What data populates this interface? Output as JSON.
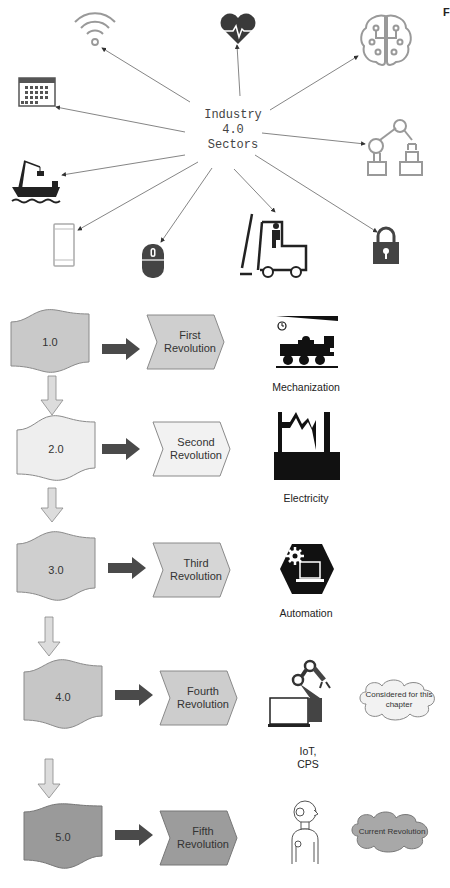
{
  "corner_mark": "F",
  "sectors": {
    "center_label_lines": [
      "Industry",
      "4.0",
      "Sectors"
    ],
    "items": [
      {
        "icon": "wifi-icon",
        "name": "connectivity"
      },
      {
        "icon": "heart-rate-icon",
        "name": "healthcare"
      },
      {
        "icon": "ai-brain-icon",
        "name": "artificial-intelligence"
      },
      {
        "icon": "calendar-icon",
        "name": "scheduling"
      },
      {
        "icon": "robot-arm-icon",
        "name": "robotics"
      },
      {
        "icon": "cargo-ship-icon",
        "name": "shipping"
      },
      {
        "icon": "smartphone-icon",
        "name": "mobile"
      },
      {
        "icon": "mouse-icon",
        "name": "computing"
      },
      {
        "icon": "forklift-icon",
        "name": "logistics"
      },
      {
        "icon": "padlock-icon",
        "name": "security"
      }
    ]
  },
  "revolutions": [
    {
      "version": "1.0",
      "title_lines": [
        "First",
        "Revolution"
      ],
      "era": "Mechanization",
      "era_icon": "steam-locomotive-icon",
      "fill": "#c9c9c9"
    },
    {
      "version": "2.0",
      "title_lines": [
        "Second",
        "Revolution"
      ],
      "era": "Electricity",
      "era_icon": "factory-power-icon",
      "fill": "#eeeeee"
    },
    {
      "version": "3.0",
      "title_lines": [
        "Third",
        "Revolution"
      ],
      "era": "Automation",
      "era_icon": "automation-hexagon-icon",
      "fill": "#cfcfcf"
    },
    {
      "version": "4.0",
      "title_lines": [
        "Fourth",
        "Revolution"
      ],
      "era_lines": [
        "IoT,",
        "CPS"
      ],
      "era_icon": "iot-robot-laptop-icon",
      "note": [
        "Considered for this",
        "chapter"
      ],
      "fill": "#c6c6c6"
    },
    {
      "version": "5.0",
      "title_lines": [
        "Fifth",
        "Revolution"
      ],
      "era_icon": "humanoid-robot-icon",
      "note": [
        "Current Revolution"
      ],
      "fill": "#9a9a9a"
    }
  ],
  "colors": {
    "arrow_dark": "#4a4a4a",
    "down_arrow_fill": "#dcdcdc",
    "shape_stroke": "#8a8a8a",
    "cloud_fill_light": "#f2f2f2",
    "cloud_fill_dark": "#a8a8a8"
  }
}
